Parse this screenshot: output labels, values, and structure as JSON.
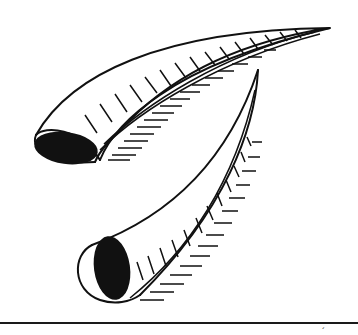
{
  "illustration": {
    "subject": "two curved horns",
    "style": "black and white line engraving",
    "background": "#ffffff",
    "ink": "#111111"
  },
  "footer": {
    "mark": "´"
  }
}
